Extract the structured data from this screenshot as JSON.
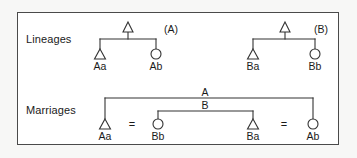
{
  "figure": {
    "name": "lineage-and-marriage-diagram",
    "border_color": "#4a4a4a",
    "line_color": "#333333",
    "text_color": "#1a1a1a",
    "background": "#ffffff"
  },
  "rows": {
    "lineages_label": "Lineages",
    "marriages_label": "Marriages"
  },
  "lineages": {
    "trees": [
      {
        "tag": "(A)",
        "apex_symbol": "triangle",
        "children": [
          {
            "symbol": "triangle",
            "label": "Aa"
          },
          {
            "symbol": "circle",
            "label": "Ab"
          }
        ]
      },
      {
        "tag": "(B)",
        "apex_symbol": "triangle",
        "children": [
          {
            "symbol": "triangle",
            "label": "Ba"
          },
          {
            "symbol": "circle",
            "label": "Bb"
          }
        ]
      }
    ]
  },
  "marriages": {
    "brackets": [
      {
        "tag": "A",
        "links": "Aa-Ab"
      },
      {
        "tag": "B",
        "links": "Bb-Ba"
      }
    ],
    "equals_sign": "=",
    "persons": [
      {
        "symbol": "triangle",
        "label": "Aa"
      },
      {
        "symbol": "circle",
        "label": "Bb"
      },
      {
        "symbol": "triangle",
        "label": "Ba"
      },
      {
        "symbol": "circle",
        "label": "Ab"
      }
    ]
  }
}
